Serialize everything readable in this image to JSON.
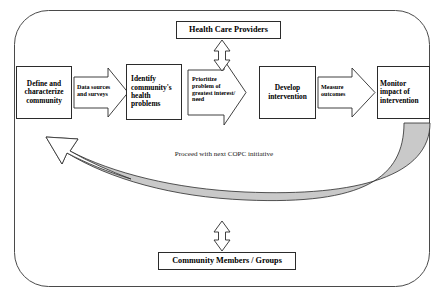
{
  "diagram": {
    "frame": {
      "name": "rounded-outer-frame",
      "stroke": "#4a4a4a"
    },
    "colors": {
      "stroke": "#2b2b2b",
      "frame_stroke": "#4a4a4a",
      "feedback_arrow_fill": "#c9c9c9",
      "box_fill": "#ffffff",
      "text": "#000000"
    },
    "stakeholder_nodes": [
      {
        "id": "providers",
        "label": "Health Care Providers"
      },
      {
        "id": "community_members",
        "label": "Community Members / Groups"
      }
    ],
    "process_steps": [
      {
        "id": "define",
        "label": "Define and\ncharacterize\ncommunity"
      },
      {
        "id": "identify",
        "label": "Identify\ncommunity's\nhealth\nproblems"
      },
      {
        "id": "develop",
        "label": "Develop\nintervention"
      },
      {
        "id": "monitor",
        "label": "Monitor\nimpact of\nintervention"
      }
    ],
    "connector_arrows": [
      {
        "id": "data_sources",
        "label": "Data sources\nand surveys"
      },
      {
        "id": "prioritize",
        "label": "Prioritize\nproblem of\ngreatest interest/\nneed"
      },
      {
        "id": "measure",
        "label": "Measure\noutcomes"
      }
    ],
    "feedback": {
      "id": "proceed",
      "label": "Proceed with next COPC initiative"
    },
    "bidirectional_links": [
      {
        "id": "providers-link",
        "from": "Health Care Providers",
        "to": "process flow"
      },
      {
        "id": "community-link",
        "from": "Community Members / Groups",
        "to": "process flow"
      }
    ]
  }
}
